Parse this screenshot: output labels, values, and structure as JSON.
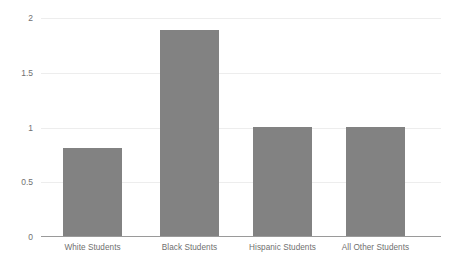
{
  "chart_data": {
    "type": "bar",
    "title": "",
    "subtitle": "",
    "xlabel": "",
    "ylabel": "",
    "categories": [
      "White Students",
      "Black Students",
      "Hispanic Students",
      "All Other Students"
    ],
    "values": [
      0.8,
      1.88,
      1.0,
      1.0
    ],
    "series": [
      {
        "name": "",
        "values": [
          0.8,
          1.88,
          1.0,
          1.0
        ]
      }
    ],
    "ylim": [
      0,
      2
    ],
    "yticks": [
      0,
      0.5,
      1,
      1.5,
      2
    ],
    "ytick_labels": [
      "0",
      "0.5",
      "1",
      "1.5",
      "2"
    ],
    "grid": true,
    "legend": false,
    "legend_position": "none",
    "bar_color": "#828282",
    "gridline_color": "#ededed",
    "axis_color": "#9a9a9a",
    "tick_label_color": "#717171",
    "category_label_color": "#6f6f6f",
    "background_color": "#ffffff"
  }
}
